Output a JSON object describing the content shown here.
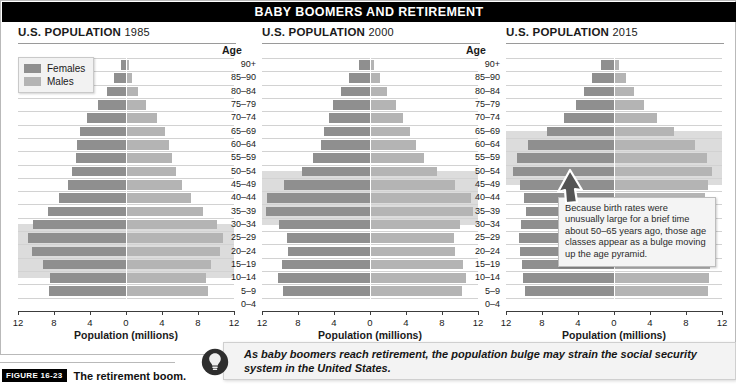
{
  "banner": {
    "title": "BABY BOOMERS AND RETIREMENT"
  },
  "legend": {
    "items": [
      {
        "label": "Females",
        "color": "#8f8f8f",
        "name": "legend-females"
      },
      {
        "label": "Males",
        "color": "#b4b4b4",
        "name": "legend-males"
      }
    ]
  },
  "age_header": "Age",
  "xaxis": {
    "title": "Population (millions)",
    "ticks": [
      12,
      8,
      4,
      0,
      4,
      8,
      12
    ],
    "max": 12
  },
  "age_groups": [
    "90+",
    "85–90",
    "80–84",
    "75–79",
    "70–74",
    "65–69",
    "60–64",
    "55–59",
    "50–54",
    "45–49",
    "40–44",
    "35–39",
    "30–34",
    "25–29",
    "20–24",
    "15–19",
    "10–14",
    "5–9",
    "0–4"
  ],
  "callout": {
    "text": "Because birth rates were unusually large for a brief time about 50–65 years ago, those age classes appear as a bulge moving up the age pyramid.",
    "arrow": "up-left-arrow"
  },
  "bottom_note": {
    "text": "As baby boomers reach retirement, the population bulge may strain the social security system in the United States.",
    "icon": "lightbulb-icon"
  },
  "caption": {
    "figure_number": "FIGURE 16-23",
    "title": "The retirement boom."
  },
  "chart_data": {
    "type": "bar",
    "title": "BABY BOOMERS AND RETIREMENT",
    "xlabel": "Population (millions)",
    "ylabel": "Age",
    "xlim": [
      -12,
      12
    ],
    "grid": true,
    "legend_position": "top-left",
    "categories": [
      "90+",
      "85–90",
      "80–84",
      "75–79",
      "70–74",
      "65–69",
      "60–64",
      "55–59",
      "50–54",
      "45–49",
      "40–44",
      "35–39",
      "30–34",
      "25–29",
      "20–24",
      "15–19",
      "10–14",
      "5–9",
      "0–4"
    ],
    "panels": [
      {
        "title_prefix": "U.S. POPULATION",
        "year": "1985",
        "highlight_bands": [
          "25–29",
          "20–24",
          "15–19"
        ],
        "series": [
          {
            "name": "Females",
            "color": "#8f8f8f",
            "values": [
              0.6,
              1.3,
              2.1,
              3.1,
              4.3,
              5.1,
              5.5,
              5.6,
              6.0,
              6.5,
              7.4,
              8.7,
              10.3,
              10.9,
              10.4,
              9.2,
              8.5,
              8.6
            ]
          },
          {
            "name": "Males",
            "color": "#b4b4b4",
            "values": [
              0.3,
              0.7,
              1.3,
              2.2,
              3.4,
              4.3,
              4.8,
              5.1,
              5.6,
              6.2,
              7.2,
              8.5,
              10.1,
              10.8,
              10.4,
              9.4,
              8.9,
              9.1
            ]
          }
        ]
      },
      {
        "title_prefix": "U.S. POPULATION",
        "year": "2000",
        "highlight_bands": [
          "45–49",
          "40–44",
          "35–39"
        ],
        "series": [
          {
            "name": "Females",
            "color": "#8f8f8f",
            "values": [
              1.2,
              2.3,
              3.2,
              4.1,
              4.6,
              5.1,
              5.5,
              6.3,
              7.6,
              9.6,
              11.4,
              11.6,
              10.1,
              9.2,
              9.1,
              9.8,
              10.2,
              9.7
            ]
          },
          {
            "name": "Males",
            "color": "#b4b4b4",
            "values": [
              0.4,
              1.1,
              1.9,
              2.9,
              3.7,
              4.4,
              5.1,
              6.0,
              7.4,
              9.4,
              11.2,
              11.4,
              10.0,
              9.3,
              9.4,
              10.3,
              10.7,
              10.2
            ]
          }
        ]
      },
      {
        "title_prefix": "U.S. POPULATION",
        "year": "2015",
        "highlight_bands": [
          "60–64",
          "55–59",
          "50–54"
        ],
        "series": [
          {
            "name": "Females",
            "color": "#8f8f8f",
            "values": [
              1.4,
              2.5,
              3.3,
              4.2,
              5.6,
              7.4,
              9.6,
              10.8,
              11.2,
              10.5,
              10.0,
              9.8,
              10.3,
              10.6,
              10.4,
              10.2,
              10.1,
              9.9
            ]
          },
          {
            "name": "Males",
            "color": "#b4b4b4",
            "values": [
              0.5,
              1.3,
              2.2,
              3.3,
              4.8,
              6.7,
              9.0,
              10.3,
              10.9,
              10.4,
              10.1,
              10.0,
              10.6,
              11.0,
              10.9,
              10.7,
              10.6,
              10.4
            ]
          }
        ]
      }
    ]
  }
}
